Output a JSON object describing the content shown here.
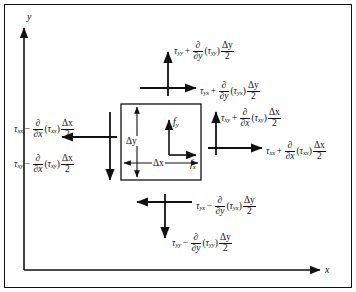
{
  "figure": {
    "axes": {
      "y_label": "y",
      "x_label": "x"
    },
    "element": {
      "height_label": "Δy",
      "width_label": "Δx",
      "body_force_y": "f",
      "body_force_y_sub": "y",
      "body_force_x": "f",
      "body_force_x_sub": "x"
    },
    "stresses": {
      "top_normal": {
        "base": "τ",
        "base_sub": "yy",
        "op": "+",
        "deriv_den_var": "y",
        "inner": "τ",
        "inner_sub": "yy",
        "delta_num": "Δy",
        "delta_den": "2",
        "arrow": "up"
      },
      "top_shear": {
        "base": "τ",
        "base_sub": "yx",
        "op": "+",
        "deriv_den_var": "y",
        "inner": "τ",
        "inner_sub": "yx",
        "delta_num": "Δy",
        "delta_den": "2",
        "arrow": "right"
      },
      "right_shear": {
        "base": "τ",
        "base_sub": "xy",
        "op": "+",
        "deriv_den_var": "x",
        "inner": "τ",
        "inner_sub": "xy",
        "delta_num": "Δx",
        "delta_den": "2",
        "arrow": "up"
      },
      "right_normal": {
        "base": "τ",
        "base_sub": "xx",
        "op": "+",
        "deriv_den_var": "x",
        "inner": "τ",
        "inner_sub": "xx",
        "delta_num": "Δx",
        "delta_den": "2",
        "arrow": "right"
      },
      "left_normal": {
        "base": "τ",
        "base_sub": "xx",
        "op": "−",
        "deriv_den_var": "x",
        "inner": "τ",
        "inner_sub": "xx",
        "delta_num": "Δx",
        "delta_den": "2",
        "arrow": "left"
      },
      "left_shear": {
        "base": "τ",
        "base_sub": "xy",
        "op": "−",
        "deriv_den_var": "x",
        "inner": "τ",
        "inner_sub": "xy",
        "delta_num": "Δx",
        "delta_den": "2",
        "arrow": "down"
      },
      "bottom_shear": {
        "base": "τ",
        "base_sub": "yx",
        "op": "−",
        "deriv_den_var": "y",
        "inner": "τ",
        "inner_sub": "yx",
        "delta_num": "Δy",
        "delta_den": "2",
        "arrow": "left"
      },
      "bottom_normal": {
        "base": "τ",
        "base_sub": "yy",
        "op": "−",
        "deriv_den_var": "y",
        "inner": "τ",
        "inner_sub": "yy",
        "delta_num": "Δy",
        "delta_den": "2",
        "arrow": "down"
      }
    },
    "symbols": {
      "partial": "∂",
      "lparen": "(",
      "rparen": ")"
    },
    "colors": {
      "ink": "#111111",
      "background": "#ffffff",
      "border": "#000000"
    }
  }
}
